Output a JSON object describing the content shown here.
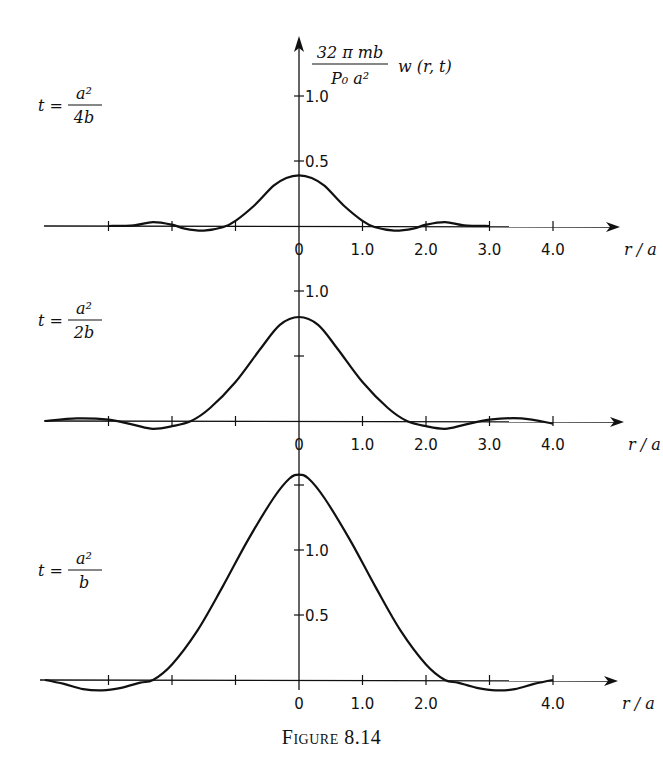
{
  "figure": {
    "caption_prefix": "Figure",
    "caption_number": "8.14"
  },
  "y_axis_label": {
    "numerator": "32 π mb",
    "denominator": "P₀ a²",
    "function": "w (r, t)"
  },
  "x_axis_label": "r / a",
  "chart_data": [
    {
      "type": "line",
      "title": "t = a²/4b",
      "panel_label": {
        "t": "t =",
        "num": "a²",
        "den": "4b"
      },
      "xlabel": "r/a",
      "ylabel": "32πmb/(P₀a²) w(r,t)",
      "xlim": [
        -4.0,
        5.0
      ],
      "ylim": [
        -0.1,
        1.1
      ],
      "x_ticks": [
        -3.0,
        -2.0,
        -1.0,
        0,
        1.0,
        2.0,
        3.0,
        4.0
      ],
      "x_tick_labels": [
        "",
        "",
        "",
        "0",
        "1.0",
        "2.0",
        "3.0",
        "4.0"
      ],
      "y_ticks": [
        0.5,
        1.0
      ],
      "y_tick_labels": [
        "0.5",
        "1.0"
      ],
      "grid": false,
      "series": [
        {
          "name": "w(r,t) at t = a²/4b",
          "x": [
            -3.0,
            -2.6,
            -2.3,
            -2.0,
            -1.8,
            -1.5,
            -1.2,
            -1.0,
            -0.7,
            -0.4,
            -0.2,
            0,
            0.2,
            0.4,
            0.7,
            1.0,
            1.2,
            1.5,
            1.8,
            2.0,
            2.3,
            2.6,
            3.0
          ],
          "y": [
            0.0,
            0.005,
            0.03,
            0.01,
            -0.02,
            -0.035,
            -0.01,
            0.04,
            0.16,
            0.31,
            0.37,
            0.39,
            0.37,
            0.31,
            0.16,
            0.04,
            -0.01,
            -0.035,
            -0.02,
            0.01,
            0.03,
            0.005,
            0.0
          ]
        }
      ]
    },
    {
      "type": "line",
      "title": "t = a²/2b",
      "panel_label": {
        "t": "t =",
        "num": "a²",
        "den": "2b"
      },
      "xlabel": "r/a",
      "xlim": [
        -4.0,
        5.0
      ],
      "ylim": [
        -0.1,
        1.1
      ],
      "x_ticks": [
        -3.0,
        -2.0,
        -1.0,
        0,
        1.0,
        2.0,
        3.0,
        4.0
      ],
      "x_tick_labels": [
        "",
        "",
        "",
        "0",
        "1.0",
        "2.0",
        "3.0",
        "4.0"
      ],
      "y_ticks": [
        0.5,
        1.0
      ],
      "y_tick_labels": [
        "",
        "1.0"
      ],
      "grid": false,
      "series": [
        {
          "name": "w(r,t) at t = a²/2b",
          "x": [
            -4.0,
            -3.5,
            -3.0,
            -2.6,
            -2.3,
            -2.0,
            -1.7,
            -1.4,
            -1.0,
            -0.6,
            -0.3,
            0,
            0.3,
            0.6,
            1.0,
            1.4,
            1.7,
            2.0,
            2.3,
            2.6,
            3.0,
            3.5,
            4.0
          ],
          "y": [
            0.0,
            0.02,
            0.01,
            -0.03,
            -0.06,
            -0.04,
            0.0,
            0.1,
            0.3,
            0.56,
            0.74,
            0.8,
            0.74,
            0.56,
            0.3,
            0.1,
            0.0,
            -0.04,
            -0.06,
            -0.03,
            0.01,
            0.02,
            -0.02
          ]
        }
      ]
    },
    {
      "type": "line",
      "title": "t = a²/b",
      "panel_label": {
        "t": "t =",
        "num": "a²",
        "den": "b"
      },
      "xlabel": "r/a",
      "xlim": [
        -4.0,
        5.0
      ],
      "ylim": [
        -0.15,
        1.7
      ],
      "x_ticks": [
        -3.0,
        -2.0,
        -1.0,
        0,
        1.0,
        2.0,
        3.0,
        4.0
      ],
      "x_tick_labels": [
        "",
        "",
        "",
        "0",
        "1.0",
        "2.0",
        "",
        "4.0"
      ],
      "y_ticks": [
        0.5,
        1.0,
        1.5
      ],
      "y_tick_labels": [
        "0.5",
        "1.0",
        ""
      ],
      "grid": false,
      "series": [
        {
          "name": "w(r,t) at t = a²/b",
          "x": [
            -4.0,
            -3.7,
            -3.4,
            -3.1,
            -2.8,
            -2.5,
            -2.3,
            -2.0,
            -1.6,
            -1.2,
            -0.8,
            -0.4,
            -0.15,
            0,
            0.15,
            0.4,
            0.8,
            1.2,
            1.6,
            2.0,
            2.3,
            2.5,
            2.8,
            3.1,
            3.4,
            3.7,
            4.0
          ],
          "y": [
            0.0,
            -0.03,
            -0.07,
            -0.08,
            -0.06,
            -0.02,
            0.0,
            0.12,
            0.38,
            0.72,
            1.08,
            1.4,
            1.55,
            1.58,
            1.55,
            1.4,
            1.08,
            0.72,
            0.38,
            0.12,
            0.0,
            -0.02,
            -0.06,
            -0.08,
            -0.07,
            -0.03,
            0.0
          ]
        }
      ]
    }
  ]
}
